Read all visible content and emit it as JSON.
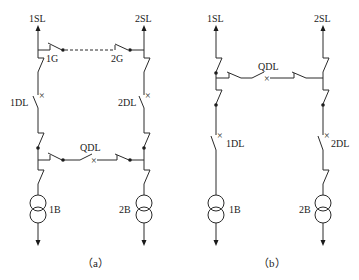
{
  "diagram": {
    "type": "electrical single-line diagram",
    "panel_a": {
      "caption": "（a）",
      "labels": {
        "source_left": "1SL",
        "source_right": "2SL",
        "isolator_left": "1G",
        "isolator_right": "2G",
        "breaker_left": "1DL",
        "breaker_right": "2DL",
        "tie_breaker": "QDL",
        "transformer_left": "1B",
        "transformer_right": "2B"
      }
    },
    "panel_b": {
      "caption": "（b）",
      "labels": {
        "source_left": "1SL",
        "source_right": "2SL",
        "tie_breaker": "QDL",
        "breaker_left": "1DL",
        "breaker_right": "2DL",
        "transformer_left": "1B",
        "transformer_right": "2B"
      }
    },
    "colors": {
      "line": "#2a2a2a",
      "background": "#ffffff"
    }
  }
}
